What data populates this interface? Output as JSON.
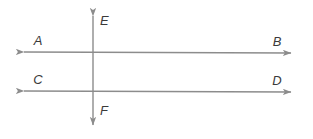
{
  "diagram": {
    "background_color": "#ffffff",
    "line_color": "#8c8c8c",
    "label_color": "#3a3a3a",
    "line_width": 1.4,
    "labels": {
      "a": "A",
      "b": "B",
      "c": "C",
      "d": "D",
      "e": "E",
      "f": "F"
    },
    "lines": [
      {
        "name": "line-ab",
        "endpoints": [
          "A",
          "B"
        ],
        "orientation": "horizontal",
        "x1": 19,
        "y1": 52,
        "x2": 296,
        "y2": 53,
        "arrows": "both"
      },
      {
        "name": "line-cd",
        "endpoints": [
          "C",
          "D"
        ],
        "orientation": "horizontal",
        "x1": 19,
        "y1": 91,
        "x2": 296,
        "y2": 92,
        "arrows": "both"
      },
      {
        "name": "line-ef",
        "endpoints": [
          "E",
          "F"
        ],
        "orientation": "vertical",
        "x1": 93,
        "y1": 10,
        "x2": 93,
        "y2": 131,
        "arrows": "both"
      }
    ],
    "label_positions": {
      "a": {
        "x": 38,
        "y": 45
      },
      "b": {
        "x": 277,
        "y": 46
      },
      "c": {
        "x": 38,
        "y": 84
      },
      "d": {
        "x": 277,
        "y": 85
      },
      "e": {
        "x": 100,
        "y": 25
      },
      "f": {
        "x": 100,
        "y": 115
      }
    },
    "intersections": [
      {
        "name": "intersection-ab-ef",
        "x": 93,
        "y": 52
      },
      {
        "name": "intersection-cd-ef",
        "x": 93,
        "y": 91
      }
    ]
  }
}
